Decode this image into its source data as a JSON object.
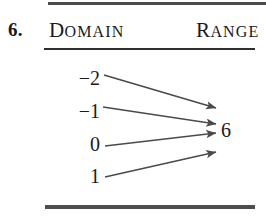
{
  "problem": {
    "number": "6."
  },
  "headers": {
    "domain": {
      "first": "D",
      "rest": "OMAIN",
      "full": "DOMAIN"
    },
    "range": {
      "first": "R",
      "rest": "ANGE",
      "full": "RANGE"
    }
  },
  "mapping": {
    "domain_values": [
      {
        "sign": "−",
        "digit": "2",
        "label": "−2"
      },
      {
        "sign": "−",
        "digit": "1",
        "label": "−1"
      },
      {
        "sign": "",
        "digit": "0",
        "label": "0"
      },
      {
        "sign": "",
        "digit": "1",
        "label": "1"
      }
    ],
    "range_values": [
      "6"
    ],
    "arrow_count": 4
  },
  "colors": {
    "ink": "#1a1a1a",
    "rule": "#3a3a3a",
    "arrow": "#4a4a4a",
    "background": "#ffffff"
  },
  "chart_data": {
    "type": "diagram",
    "diagram_kind": "mapping-diagram",
    "title": "6.",
    "columns": [
      "DOMAIN",
      "RANGE"
    ],
    "domain": [
      -2,
      -1,
      0,
      1
    ],
    "range": [
      6
    ],
    "pairs": [
      {
        "from": "-2",
        "to": "6"
      },
      {
        "from": "-1",
        "to": "6"
      },
      {
        "from": "0",
        "to": "6"
      },
      {
        "from": "1",
        "to": "6"
      }
    ],
    "arrows": [
      {
        "x1": 104,
        "y1": 75,
        "x2": 216,
        "y2": 108
      },
      {
        "x1": 103,
        "y1": 107,
        "x2": 216,
        "y2": 124
      },
      {
        "x1": 105,
        "y1": 146,
        "x2": 216,
        "y2": 133
      },
      {
        "x1": 105,
        "y1": 177,
        "x2": 216,
        "y2": 152
      }
    ],
    "value_positions": [
      {
        "label": "-2",
        "top": 68
      },
      {
        "label": "-1",
        "top": 101
      },
      {
        "label": "0",
        "top": 134
      },
      {
        "label": "1",
        "top": 166
      }
    ]
  }
}
